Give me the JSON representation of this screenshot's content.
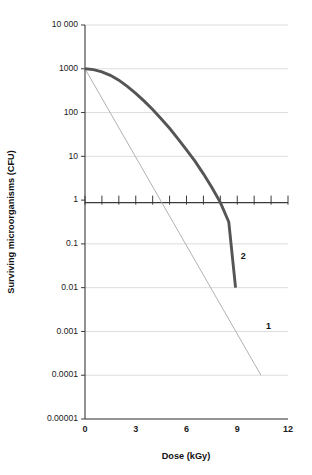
{
  "chart_data": {
    "type": "line",
    "title": "",
    "xlabel": "Dose (kGy)",
    "ylabel": "Surviving microorganisms (CFU)",
    "xlim": [
      0,
      12
    ],
    "ylim": [
      1e-05,
      10000
    ],
    "yscale": "log",
    "grid": "horizontal",
    "legend_position": "inline-annotations",
    "xticks": [
      0,
      3,
      6,
      9,
      12
    ],
    "xtick_labels": [
      "0",
      "3",
      "6",
      "9",
      "12"
    ],
    "xminor_ticks": [
      0,
      1,
      2,
      3,
      4,
      5,
      6,
      7,
      8,
      9,
      10,
      11,
      12
    ],
    "yticks": [
      10000,
      1000,
      100,
      10,
      1,
      0.1,
      0.01,
      0.001,
      0.0001,
      1e-05
    ],
    "ytick_labels": [
      "10 000",
      "1000",
      "100",
      "10",
      "1",
      "0.1",
      "0.01",
      "0.001",
      "0.0001",
      "0.00001"
    ],
    "series": [
      {
        "name": "1",
        "label": "1",
        "style": "thin-line",
        "color": "#a8a8a8",
        "description": "Exponential (first-order) inactivation, no shoulder",
        "x": [
          0,
          1,
          2,
          3,
          4,
          5,
          6,
          7,
          8,
          9,
          10,
          10.4
        ],
        "y": [
          1000,
          158,
          25.1,
          3.98,
          0.631,
          0.1,
          0.0158,
          0.00251,
          0.000398,
          6.31e-05,
          1e-05,
          0.0001
        ],
        "points": [
          {
            "x": 0,
            "y": 1000
          },
          {
            "x": 10.4,
            "y": 0.0001
          }
        ],
        "label_position": {
          "x": 10.85,
          "y": 0.0013
        }
      },
      {
        "name": "2",
        "label": "2",
        "style": "thick-line",
        "color": "#555555",
        "description": "Sigmoidal inactivation with initial shoulder",
        "x": [
          0,
          0.5,
          1,
          1.5,
          2,
          2.5,
          3,
          3.5,
          4,
          4.5,
          5,
          5.5,
          6,
          6.5,
          7,
          7.5,
          8,
          8.5,
          8.9
        ],
        "y": [
          1000,
          955,
          851,
          708,
          550,
          398,
          275,
          182,
          117,
          72.4,
          43.7,
          25.1,
          14.1,
          7.76,
          3.98,
          1.95,
          0.891,
          0.316,
          0.01
        ],
        "points": [
          {
            "x": 0,
            "y": 1000
          },
          {
            "x": 8.9,
            "y": 0.01
          }
        ],
        "label_position": {
          "x": 9.35,
          "y": 0.05
        }
      }
    ],
    "annotations": [
      {
        "text": "1",
        "series": "1"
      },
      {
        "text": "2",
        "series": "2"
      }
    ],
    "colors": {
      "background": "#ffffff",
      "axis": "#3a3a3a",
      "gridline": "#d9d9d9",
      "series_1": "#a8a8a8",
      "series_2": "#555555",
      "text": "#1b1b1b"
    }
  }
}
